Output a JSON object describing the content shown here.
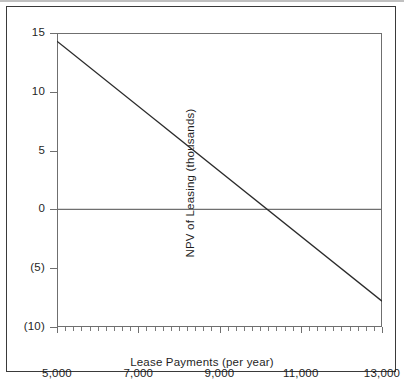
{
  "figure": {
    "border_color": "#3a3a3a",
    "axis_color": "#6f6f6f",
    "line_color": "#2b2b2b"
  },
  "chart_data": {
    "type": "line",
    "title": "",
    "subtitle": "",
    "xlabel": "Lease Payments (per year)",
    "ylabel": "NPV of Leasing (thousands)",
    "xlim": [
      5000,
      13000
    ],
    "ylim": [
      -10,
      15
    ],
    "grid": false,
    "legend": null,
    "x_tick_labels": [
      "5,000",
      "7,000",
      "9,000",
      "11,000",
      "13,000"
    ],
    "x_tick_values": [
      5000,
      7000,
      9000,
      11000,
      13000
    ],
    "x_minor_tick_step": 200,
    "y_tick_labels": [
      "15",
      "10",
      "5",
      "0",
      "(5)",
      "(10)"
    ],
    "y_tick_values": [
      15,
      10,
      5,
      0,
      -5,
      -10
    ],
    "zero_reference_line": 0,
    "series": [
      {
        "name": "NPV of Leasing",
        "x": [
          5000,
          13000
        ],
        "values": [
          14.3,
          -7.8
        ],
        "x_intercept": 10100
      }
    ],
    "annotations": []
  }
}
